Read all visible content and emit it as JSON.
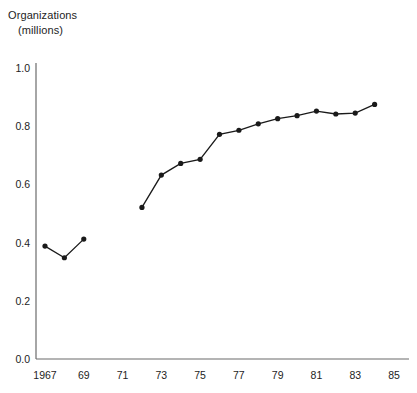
{
  "chart_data": {
    "type": "line",
    "title": "",
    "ylabel_line1": "Organizations",
    "ylabel_line2": "(millions)",
    "xlabel": "",
    "ylim": [
      0.0,
      1.05
    ],
    "xlim": [
      1967,
      1985
    ],
    "grid": false,
    "legend": null,
    "ytick_labels": [
      "1.0",
      "0.8",
      "0.6",
      "0.4",
      "0.2",
      "0.0"
    ],
    "ytick_values": [
      1.0,
      0.8,
      0.6,
      0.4,
      0.2,
      0.0
    ],
    "xtick_labels": [
      "1967",
      "69",
      "71",
      "73",
      "75",
      "77",
      "79",
      "81",
      "83",
      "85"
    ],
    "xtick_values": [
      1967,
      1969,
      1971,
      1973,
      1975,
      1977,
      1979,
      1981,
      1983,
      1985
    ],
    "marker": "filled-circle",
    "line_color": "#1a1a1a",
    "marker_color": "#1a1a1a",
    "segments": [
      {
        "name": "1967-1969",
        "x": [
          1967,
          1968,
          1969
        ],
        "y": [
          0.388,
          0.348,
          0.412
        ]
      },
      {
        "name": "1972-1984",
        "x": [
          1972,
          1973,
          1974,
          1975,
          1976,
          1977,
          1978,
          1979,
          1980,
          1981,
          1982,
          1983,
          1984
        ],
        "y": [
          0.521,
          0.632,
          0.672,
          0.686,
          0.772,
          0.786,
          0.808,
          0.826,
          0.836,
          0.852,
          0.842,
          0.845,
          0.875
        ]
      }
    ]
  },
  "axes": {
    "x_axis_name": "year-axis",
    "y_axis_name": "organizations-axis"
  }
}
